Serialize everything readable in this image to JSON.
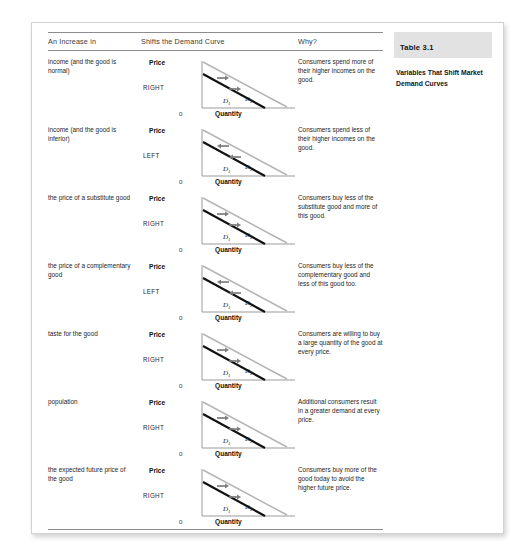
{
  "table": {
    "headers": {
      "factor": "An Increase in",
      "graph": "Shifts the Demand Curve",
      "why": "Why?"
    },
    "rows": [
      {
        "factor": "income (and the good is normal)",
        "direction": "RIGHT",
        "shift": "right",
        "why": "Consumers spend more of their higher incomes on the good."
      },
      {
        "factor": "income (and the good is inferior)",
        "direction": "LEFT",
        "shift": "left",
        "why": "Consumers spend less of their higher incomes on the good."
      },
      {
        "factor": "the price of a substitute good",
        "direction": "RIGHT",
        "shift": "right",
        "why": "Consumers buy less of the substitute good and more of this good."
      },
      {
        "factor": "the price of a complementary good",
        "direction": "LEFT",
        "shift": "left",
        "why": "Consumers buy less of the complementary good and less of this good too."
      },
      {
        "factor": "taste for the good",
        "direction": "RIGHT",
        "shift": "right",
        "why": "Consumers are willing to buy a large quantity of the good at every price."
      },
      {
        "factor": "population",
        "direction": "RIGHT",
        "shift": "right",
        "why": "Additional consumers result in a greater demand at every price."
      },
      {
        "factor": "the expected future price of the good",
        "direction": "RIGHT",
        "shift": "right",
        "why": "Consumers buy more of the good today to avoid the higher future price."
      }
    ]
  },
  "graph_labels": {
    "y_axis": "Price",
    "x_axis": "Quantity",
    "origin": "0",
    "curve_1": "D",
    "curve_1_sub": "1",
    "curve_2": "D",
    "curve_2_sub": "2"
  },
  "side_panel": {
    "table_number": "Table 3.1",
    "caption": "Variables That Shift Market Demand Curves"
  },
  "colors": {
    "curve_initial": "#111111",
    "curve_shifted": "#b4b4b4",
    "axis": "#9a9a9a",
    "arrow": "#7d7d7d",
    "band": "#e2e2e2",
    "rule": "#8d8d8d"
  }
}
